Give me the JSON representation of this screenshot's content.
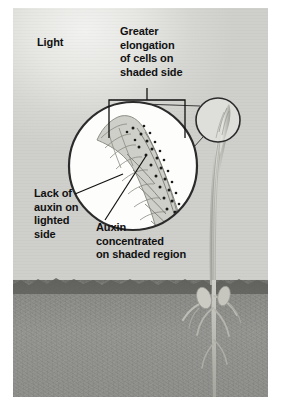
{
  "figure": {
    "labels": {
      "light": "Light",
      "greater_elongation": "Greater\nelongation\nof cells on\nshaded side",
      "lack_of_auxin": "Lack of\nauxin on\nlighted\nside",
      "auxin_concentrated": "Auxin\nconcentrated\non shaded region"
    },
    "colors": {
      "sky": "#d9d9d6",
      "soil": "#8a8a87",
      "ink": "#111111",
      "plant": "#b9b9b4",
      "auxin_dot": "#1a1a1a",
      "circle_stroke": "#2b2b2b"
    },
    "scene": {
      "ground_line_y": 272,
      "light_direction": "from upper left",
      "magnifier": {
        "cx": 120,
        "cy": 158,
        "r": 64
      },
      "callout_circle": {
        "cx": 205,
        "cy": 112,
        "r": 22
      },
      "bracket": {
        "x1": 96,
        "x2": 172,
        "y": 92,
        "depth": 38
      }
    },
    "auxin_dots_count": 34
  }
}
